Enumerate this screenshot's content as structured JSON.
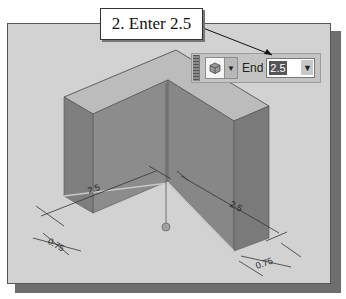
{
  "callout": {
    "text": "2. Enter 2.5"
  },
  "toolbar": {
    "type_icon": "extrude-cube-icon",
    "type_dropdown_icon": "chevron-down-icon",
    "end_label": "End",
    "end_value": "2.5",
    "end_spinner_icon": "arrow-down-icon"
  },
  "model": {
    "dimensions": [
      {
        "id": "length-left",
        "value": "2.5"
      },
      {
        "id": "length-right",
        "value": "2.5"
      },
      {
        "id": "thickness-left",
        "value": "0.75"
      },
      {
        "id": "thickness-right",
        "value": "0.75"
      }
    ]
  },
  "colors": {
    "viewport_bg": "#d2d2d2",
    "top_face": "#bcbcbc",
    "front_face": "#8a8a8a",
    "side_face": "#7c7c7c",
    "frame_shadow": "#6e6e6e"
  }
}
